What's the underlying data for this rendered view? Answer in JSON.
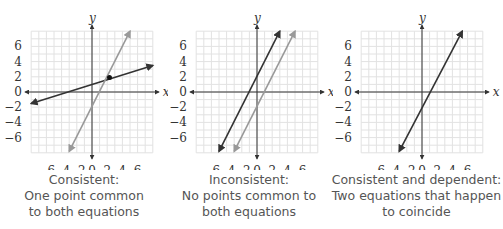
{
  "colors": {
    "grid": "#e2e2e2",
    "axis": "#333333",
    "line_dark": "#333333",
    "line_light": "#999999",
    "caption": "#555555"
  },
  "axes": {
    "x_label": "x",
    "y_label": "y",
    "x_ticks": [
      "−6",
      "−4",
      "−2",
      "0",
      "2",
      "4",
      "6"
    ],
    "y_ticks": [
      "6",
      "4",
      "2",
      "0",
      "−2",
      "−4",
      "−6"
    ],
    "range": [
      -8,
      8
    ]
  },
  "panels": [
    {
      "caption": [
        "Consistent:",
        "One point common",
        "to both equations"
      ],
      "lines": [
        {
          "color": "line_dark",
          "from": [
            -8,
            -1.5
          ],
          "to": [
            8,
            3.5
          ]
        },
        {
          "color": "line_light",
          "from": [
            -3,
            -7.8
          ],
          "to": [
            5,
            8
          ]
        }
      ],
      "point": [
        2.3,
        1.9
      ]
    },
    {
      "caption": [
        "Inconsistent:",
        "No points common to",
        "both equations"
      ],
      "lines": [
        {
          "color": "line_dark",
          "from": [
            -5,
            -7.8
          ],
          "to": [
            3,
            8
          ]
        },
        {
          "color": "line_light",
          "from": [
            -3,
            -7.8
          ],
          "to": [
            5,
            8
          ]
        }
      ]
    },
    {
      "caption": [
        "Consistent and dependent:",
        "Two equations that happen",
        "to coincide"
      ],
      "lines": [
        {
          "color": "line_dark",
          "from": [
            -3,
            -7.8
          ],
          "to": [
            5.3,
            8
          ]
        }
      ]
    }
  ]
}
